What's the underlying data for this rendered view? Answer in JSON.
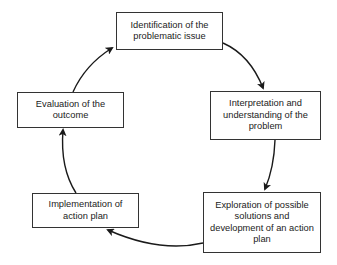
{
  "diagram": {
    "type": "cycle",
    "direction": "clockwise",
    "line_color": "#1a1a1a",
    "nodes": [
      {
        "id": "identification",
        "label": "Identification of the problematic issue"
      },
      {
        "id": "interpretation",
        "label": "Interpretation and understanding of the problem"
      },
      {
        "id": "exploration",
        "label": "Exploration of possible solutions and development of an action plan"
      },
      {
        "id": "implementation",
        "label": "Implementation of action plan"
      },
      {
        "id": "evaluation",
        "label": "Evaluation of the outcome"
      }
    ],
    "edges": [
      {
        "from": "identification",
        "to": "interpretation"
      },
      {
        "from": "interpretation",
        "to": "exploration"
      },
      {
        "from": "exploration",
        "to": "implementation"
      },
      {
        "from": "implementation",
        "to": "evaluation"
      },
      {
        "from": "evaluation",
        "to": "identification"
      }
    ]
  }
}
